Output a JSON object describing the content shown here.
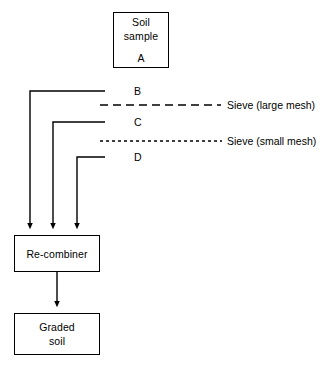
{
  "diagram": {
    "background_color": "#ffffff",
    "stroke_color": "#000000",
    "nodes": [
      {
        "id": "soil-sample",
        "lines": [
          "Soil",
          "sample"
        ],
        "sub_label": "A",
        "x": 113,
        "y": 12,
        "w": 56,
        "h": 56
      },
      {
        "id": "re-combiner",
        "lines": [
          "Re-combiner"
        ],
        "sub_label": "",
        "x": 14,
        "y": 235,
        "w": 86,
        "h": 37
      },
      {
        "id": "graded-soil",
        "lines": [
          "Graded",
          "soil"
        ],
        "sub_label": "",
        "x": 14,
        "y": 313,
        "w": 86,
        "h": 42
      }
    ],
    "fraction_labels": [
      {
        "id": "b",
        "text": "B",
        "x": 134,
        "y": 85
      },
      {
        "id": "c",
        "text": "C",
        "x": 134,
        "y": 116
      },
      {
        "id": "d",
        "text": "D",
        "x": 134,
        "y": 151
      }
    ],
    "sieves": [
      {
        "id": "large-mesh",
        "label": "Sieve  (large mesh)",
        "label_x": 227,
        "label_y": 99,
        "line_y": 105,
        "line_x1": 100,
        "line_x2": 221,
        "dash": "8,5"
      },
      {
        "id": "small-mesh",
        "label": "Sieve  (small mesh)",
        "label_x": 227,
        "label_y": 135,
        "line_y": 141,
        "line_x1": 100,
        "line_x2": 222,
        "dash": "3,3"
      }
    ],
    "paths": [
      {
        "id": "b-to-recombiner",
        "from": "B",
        "to": "Re-combiner",
        "x_drop": 30,
        "y_top": 91,
        "x_right": 105
      },
      {
        "id": "c-to-recombiner",
        "from": "C",
        "to": "Re-combiner",
        "x_drop": 53,
        "y_top": 122,
        "x_right": 105
      },
      {
        "id": "d-to-recombiner",
        "from": "D",
        "to": "Re-combiner",
        "x_drop": 77,
        "y_top": 157,
        "x_right": 105
      }
    ],
    "arrow_y_end": 232,
    "recombiner_to_graded": {
      "x": 57,
      "y1": 272,
      "y2": 310
    }
  }
}
